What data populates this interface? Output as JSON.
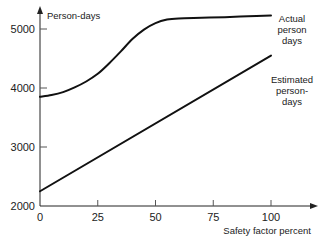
{
  "chart_data": {
    "type": "line",
    "title": "",
    "xlabel": "Safety factor percent",
    "ylabel": "Person-days",
    "xlim": [
      0,
      120
    ],
    "ylim": [
      2000,
      5300
    ],
    "grid": false,
    "x_ticks": [
      0,
      25,
      50,
      75,
      100
    ],
    "x_tick_labels": [
      "0",
      "25",
      "50",
      "75",
      "100"
    ],
    "y_ticks": [
      2000,
      3000,
      4000,
      5000
    ],
    "y_tick_labels": [
      "2000",
      "3000",
      "4000",
      "5000"
    ],
    "legend": "inline-right",
    "series": [
      {
        "name": "Actual person days",
        "label_lines": [
          "Actual",
          "person",
          "days"
        ],
        "x": [
          0,
          5,
          10,
          15,
          20,
          25,
          30,
          35,
          40,
          45,
          50,
          55,
          60,
          70,
          80,
          90,
          100
        ],
        "y": [
          3850,
          3880,
          3930,
          4010,
          4110,
          4240,
          4420,
          4620,
          4830,
          4990,
          5100,
          5160,
          5180,
          5190,
          5200,
          5215,
          5230
        ]
      },
      {
        "name": "Estimated person-days",
        "label_lines": [
          "Estimated",
          "person-",
          "days"
        ],
        "x": [
          0,
          100
        ],
        "y": [
          2250,
          4550
        ]
      }
    ]
  }
}
